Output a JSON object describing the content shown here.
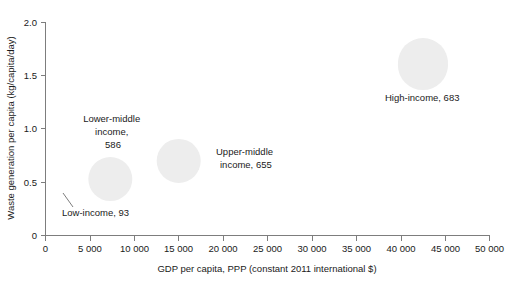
{
  "chart_data": {
    "type": "scatter",
    "title": "",
    "subtitle": "",
    "xlabel": "GDP per capita, PPP (constant 2011 international $)",
    "ylabel": "Waste generation per capita (kg/capita/day)",
    "xlim": [
      0,
      50000
    ],
    "ylim": [
      0,
      2.0
    ],
    "grid": false,
    "legend": "none",
    "xticks": [
      0,
      5000,
      10000,
      15000,
      20000,
      25000,
      30000,
      35000,
      40000,
      45000,
      50000
    ],
    "xticklabels": [
      "0",
      "5 000",
      "10 000",
      "15 000",
      "20 000",
      "25 000",
      "30 000",
      "35 000",
      "40 000",
      "45 000",
      "50 000"
    ],
    "yticks": [
      0,
      0.5,
      1.0,
      1.5,
      2.0
    ],
    "yticklabels": [
      "0",
      "0.5",
      "1.0",
      "1.5",
      "2.0"
    ],
    "bubble_color": "#ededed",
    "points": [
      {
        "name": "Low-income",
        "x": 1700,
        "y": 0.42,
        "size": 93,
        "radius_px": 8,
        "label": "Low-income, 93",
        "label_lines": [
          "Low-income, 93"
        ],
        "label_x_px": 62,
        "label_y_px": 216,
        "label_anchor": "start",
        "leader": true
      },
      {
        "name": "Lower-middle income",
        "x": 7300,
        "y": 0.53,
        "size": 586,
        "radius_px": 22,
        "label": "Lower-middle income, 586",
        "label_lines": [
          "Lower-middle",
          "income,",
          "586"
        ],
        "label_x_px": 113,
        "label_y_px": 122,
        "label_anchor": "middle",
        "leader": false
      },
      {
        "name": "Upper-middle income",
        "x": 15000,
        "y": 0.7,
        "size": 655,
        "radius_px": 22,
        "label": "Upper-middle income, 655",
        "label_lines": [
          "Upper-middle",
          "income, 655"
        ],
        "label_x_px": 216,
        "label_y_px": 155,
        "label_anchor": "start",
        "leader": false
      },
      {
        "name": "High-income",
        "x": 42500,
        "y": 1.6,
        "size": 683,
        "radius_px": 25,
        "label": "High-income, 683",
        "label_lines": [
          "High-income, 683"
        ],
        "label_x_px": 385,
        "label_y_px": 101,
        "label_anchor": "start",
        "leader": false
      }
    ]
  }
}
